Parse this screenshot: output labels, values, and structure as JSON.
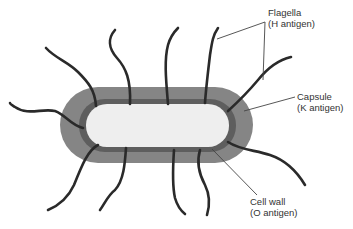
{
  "diagram": {
    "colors": {
      "capsule": "#858585",
      "cell_wall": "#5e5e5e",
      "cytoplasm": "#eeeeee",
      "flagella": "#2a2a2a",
      "leader_line": "#444444"
    },
    "labels": [
      {
        "id": "flagella",
        "line1": "Flagella",
        "line2": "(H antigen)"
      },
      {
        "id": "capsule",
        "line1": "Capsule",
        "line2": "(K antigen)"
      },
      {
        "id": "cell_wall",
        "line1": "Cell wall",
        "line2": "(O antigen)"
      }
    ]
  }
}
